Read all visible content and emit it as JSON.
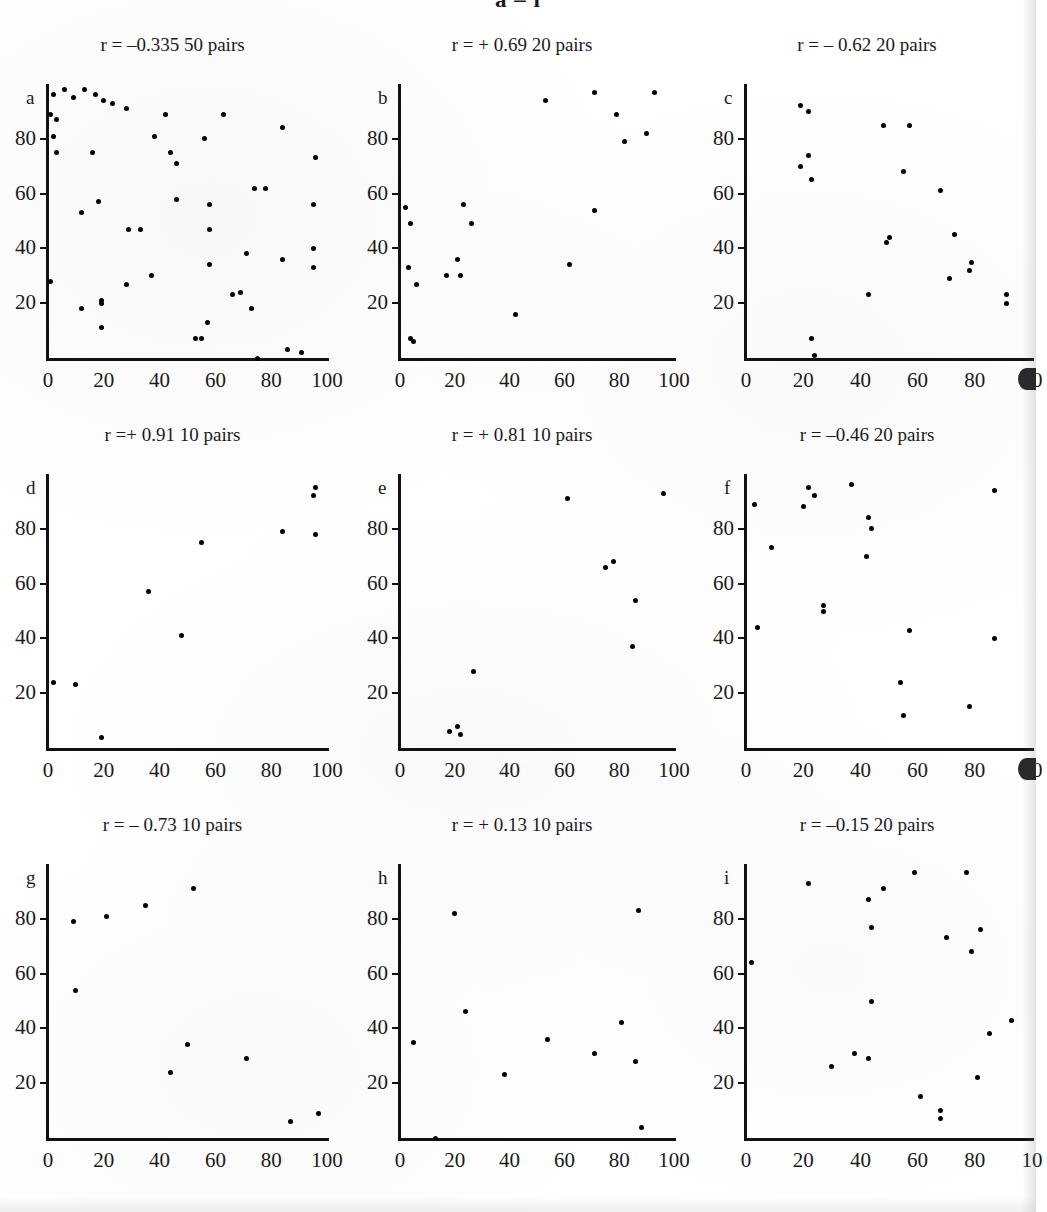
{
  "figure": {
    "title": "a – i",
    "x_ticks": [
      "0",
      "20",
      "40",
      "60",
      "80",
      "100"
    ],
    "x_ticks_truncated": [
      "0",
      "20",
      "40",
      "60",
      "80",
      "10"
    ],
    "y_ticks": [
      "20",
      "40",
      "60",
      "80"
    ]
  },
  "chart_data": [
    {
      "type": "scatter",
      "panel": "a",
      "title": "r = –0.335   50 pairs",
      "r": -0.335,
      "n_pairs": 50,
      "xlabel": "",
      "ylabel": "",
      "xlim": [
        0,
        100
      ],
      "ylim": [
        0,
        100
      ],
      "xticks": [
        0,
        20,
        40,
        60,
        80,
        100
      ],
      "yticks": [
        20,
        40,
        60,
        80
      ],
      "grid": false,
      "legend": "none",
      "points": [
        [
          2,
          96
        ],
        [
          6,
          98
        ],
        [
          9,
          95
        ],
        [
          13,
          98
        ],
        [
          17,
          96
        ],
        [
          20,
          94
        ],
        [
          23,
          93
        ],
        [
          28,
          91
        ],
        [
          3,
          87
        ],
        [
          1,
          89
        ],
        [
          42,
          89
        ],
        [
          63,
          89
        ],
        [
          2,
          81
        ],
        [
          38,
          81
        ],
        [
          56,
          80
        ],
        [
          3,
          75
        ],
        [
          16,
          75
        ],
        [
          44,
          75
        ],
        [
          84,
          84
        ],
        [
          46,
          71
        ],
        [
          96,
          73
        ],
        [
          12,
          53
        ],
        [
          18,
          57
        ],
        [
          46,
          58
        ],
        [
          58,
          56
        ],
        [
          74,
          62
        ],
        [
          78,
          62
        ],
        [
          95,
          56
        ],
        [
          29,
          47
        ],
        [
          33,
          47
        ],
        [
          58,
          47
        ],
        [
          71,
          38
        ],
        [
          95,
          40
        ],
        [
          84,
          36
        ],
        [
          58,
          34
        ],
        [
          95,
          33
        ],
        [
          1,
          28
        ],
        [
          28,
          27
        ],
        [
          37,
          30
        ],
        [
          19,
          21
        ],
        [
          19,
          20
        ],
        [
          66,
          23
        ],
        [
          69,
          24
        ],
        [
          12,
          18
        ],
        [
          73,
          18
        ],
        [
          19,
          11
        ],
        [
          57,
          13
        ],
        [
          53,
          7
        ],
        [
          55,
          7
        ],
        [
          86,
          3
        ],
        [
          91,
          2
        ],
        [
          75,
          0
        ]
      ]
    },
    {
      "type": "scatter",
      "panel": "b",
      "title": "r = + 0.69    20 pairs",
      "r": 0.69,
      "n_pairs": 20,
      "xlabel": "",
      "ylabel": "",
      "xlim": [
        0,
        100
      ],
      "ylim": [
        0,
        100
      ],
      "xticks": [
        0,
        20,
        40,
        60,
        80,
        100
      ],
      "yticks": [
        20,
        40,
        60,
        80
      ],
      "grid": false,
      "legend": "none",
      "points": [
        [
          53,
          94
        ],
        [
          71,
          97
        ],
        [
          93,
          97
        ],
        [
          79,
          89
        ],
        [
          82,
          79
        ],
        [
          90,
          82
        ],
        [
          2,
          55
        ],
        [
          71,
          54
        ],
        [
          23,
          56
        ],
        [
          26,
          49
        ],
        [
          4,
          49
        ],
        [
          21,
          36
        ],
        [
          62,
          34
        ],
        [
          3,
          33
        ],
        [
          17,
          30
        ],
        [
          22,
          30
        ],
        [
          6,
          27
        ],
        [
          42,
          16
        ],
        [
          4,
          7
        ],
        [
          5,
          6
        ]
      ]
    },
    {
      "type": "scatter",
      "panel": "c",
      "title": "r = – 0.62  20 pairs",
      "r": -0.62,
      "n_pairs": 20,
      "xlabel": "",
      "ylabel": "",
      "xlim": [
        0,
        100
      ],
      "ylim": [
        0,
        100
      ],
      "xticks": [
        0,
        20,
        40,
        60,
        80,
        100
      ],
      "yticks": [
        20,
        40,
        60,
        80
      ],
      "grid": false,
      "legend": "none",
      "points": [
        [
          19,
          92
        ],
        [
          22,
          90
        ],
        [
          48,
          85
        ],
        [
          57,
          85
        ],
        [
          22,
          74
        ],
        [
          19,
          70
        ],
        [
          23,
          65
        ],
        [
          55,
          68
        ],
        [
          68,
          61
        ],
        [
          50,
          44
        ],
        [
          49,
          42
        ],
        [
          73,
          45
        ],
        [
          79,
          35
        ],
        [
          78,
          32
        ],
        [
          71,
          29
        ],
        [
          43,
          23
        ],
        [
          91,
          23
        ],
        [
          91,
          20
        ],
        [
          23,
          7
        ],
        [
          24,
          1
        ]
      ]
    },
    {
      "type": "scatter",
      "panel": "d",
      "title": "r =+ 0.91   10 pairs",
      "r": 0.91,
      "n_pairs": 10,
      "xlabel": "",
      "ylabel": "",
      "xlim": [
        0,
        100
      ],
      "ylim": [
        0,
        100
      ],
      "xticks": [
        0,
        20,
        40,
        60,
        80,
        100
      ],
      "yticks": [
        20,
        40,
        60,
        80
      ],
      "grid": false,
      "legend": "none",
      "points": [
        [
          96,
          95
        ],
        [
          95,
          92
        ],
        [
          84,
          79
        ],
        [
          96,
          78
        ],
        [
          55,
          75
        ],
        [
          36,
          57
        ],
        [
          48,
          41
        ],
        [
          2,
          24
        ],
        [
          10,
          23
        ],
        [
          19,
          4
        ]
      ]
    },
    {
      "type": "scatter",
      "panel": "e",
      "title": "r = + 0.81    10 pairs",
      "r": 0.81,
      "n_pairs": 10,
      "xlabel": "",
      "ylabel": "",
      "xlim": [
        0,
        100
      ],
      "ylim": [
        0,
        100
      ],
      "xticks": [
        0,
        20,
        40,
        60,
        80,
        100
      ],
      "yticks": [
        20,
        40,
        60,
        80
      ],
      "grid": false,
      "legend": "none",
      "points": [
        [
          61,
          91
        ],
        [
          96,
          93
        ],
        [
          78,
          68
        ],
        [
          75,
          66
        ],
        [
          86,
          54
        ],
        [
          85,
          37
        ],
        [
          27,
          28
        ],
        [
          21,
          8
        ],
        [
          18,
          6
        ],
        [
          22,
          5
        ]
      ]
    },
    {
      "type": "scatter",
      "panel": "f",
      "title": "r = –0.46   20 pairs",
      "r": -0.46,
      "n_pairs": 20,
      "xlabel": "",
      "ylabel": "",
      "xlim": [
        0,
        100
      ],
      "ylim": [
        0,
        100
      ],
      "xticks": [
        0,
        20,
        40,
        60,
        80,
        100
      ],
      "yticks": [
        20,
        40,
        60,
        80
      ],
      "grid": false,
      "legend": "none",
      "points": [
        [
          22,
          95
        ],
        [
          24,
          92
        ],
        [
          37,
          96
        ],
        [
          87,
          94
        ],
        [
          20,
          88
        ],
        [
          3,
          89
        ],
        [
          43,
          84
        ],
        [
          44,
          80
        ],
        [
          9,
          73
        ],
        [
          42,
          70
        ],
        [
          27,
          52
        ],
        [
          27,
          50
        ],
        [
          4,
          44
        ],
        [
          57,
          43
        ],
        [
          87,
          40
        ],
        [
          54,
          24
        ],
        [
          78,
          15
        ],
        [
          55,
          12
        ]
      ]
    },
    {
      "type": "scatter",
      "panel": "g",
      "title": "r = – 0.73   10 pairs",
      "r": -0.73,
      "n_pairs": 10,
      "xlabel": "",
      "ylabel": "",
      "xlim": [
        0,
        100
      ],
      "ylim": [
        0,
        100
      ],
      "xticks": [
        0,
        20,
        40,
        60,
        80,
        100
      ],
      "yticks": [
        20,
        40,
        60,
        80
      ],
      "grid": false,
      "legend": "none",
      "points": [
        [
          52,
          91
        ],
        [
          35,
          85
        ],
        [
          21,
          81
        ],
        [
          9,
          79
        ],
        [
          10,
          54
        ],
        [
          50,
          34
        ],
        [
          71,
          29
        ],
        [
          44,
          24
        ],
        [
          97,
          9
        ],
        [
          87,
          6
        ]
      ]
    },
    {
      "type": "scatter",
      "panel": "h",
      "title": "r = + 0.13  10 pairs",
      "r": 0.13,
      "n_pairs": 10,
      "xlabel": "",
      "ylabel": "",
      "xlim": [
        0,
        100
      ],
      "ylim": [
        0,
        100
      ],
      "xticks": [
        0,
        20,
        40,
        60,
        80,
        100
      ],
      "yticks": [
        20,
        40,
        60,
        80
      ],
      "grid": false,
      "legend": "none",
      "points": [
        [
          20,
          82
        ],
        [
          87,
          83
        ],
        [
          24,
          46
        ],
        [
          81,
          42
        ],
        [
          54,
          36
        ],
        [
          5,
          35
        ],
        [
          71,
          31
        ],
        [
          86,
          28
        ],
        [
          38,
          23
        ],
        [
          88,
          4
        ],
        [
          13,
          0
        ]
      ]
    },
    {
      "type": "scatter",
      "panel": "i",
      "title": "r = –0.15   20 pairs",
      "r": -0.15,
      "n_pairs": 20,
      "xlabel": "",
      "ylabel": "",
      "xlim": [
        0,
        100
      ],
      "ylim": [
        0,
        100
      ],
      "xticks": [
        0,
        20,
        40,
        60,
        80,
        100
      ],
      "yticks": [
        20,
        40,
        60,
        80
      ],
      "grid": false,
      "legend": "none",
      "points": [
        [
          59,
          97
        ],
        [
          77,
          97
        ],
        [
          22,
          93
        ],
        [
          48,
          91
        ],
        [
          43,
          87
        ],
        [
          44,
          77
        ],
        [
          82,
          76
        ],
        [
          70,
          73
        ],
        [
          79,
          68
        ],
        [
          2,
          64
        ],
        [
          44,
          50
        ],
        [
          93,
          43
        ],
        [
          85,
          38
        ],
        [
          38,
          31
        ],
        [
          43,
          29
        ],
        [
          30,
          26
        ],
        [
          81,
          22
        ],
        [
          61,
          15
        ],
        [
          68,
          10
        ],
        [
          68,
          7
        ]
      ]
    }
  ]
}
